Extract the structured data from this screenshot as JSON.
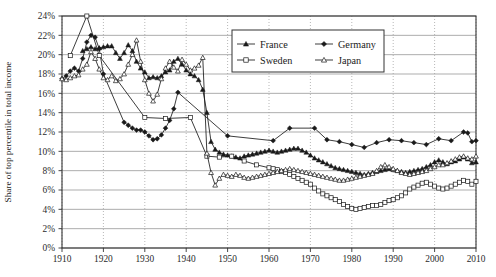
{
  "chart_data": {
    "type": "line",
    "title": "",
    "xlabel": "",
    "ylabel": "Share of top percentile in total income",
    "xlim": [
      1910,
      2010
    ],
    "ylim": [
      0,
      24
    ],
    "grid": true,
    "legend_position": "top-right",
    "xticks": [
      "1910",
      "1920",
      "1930",
      "1940",
      "1950",
      "1960",
      "1970",
      "1980",
      "1990",
      "2000",
      "2010"
    ],
    "yticks": [
      "0%",
      "2%",
      "4%",
      "6%",
      "8%",
      "10%",
      "12%",
      "14%",
      "16%",
      "18%",
      "20%",
      "22%",
      "24%"
    ],
    "series": [
      {
        "name": "France",
        "marker": "filled-triangle",
        "x": [
          1915,
          1916,
          1917,
          1918,
          1919,
          1920,
          1921,
          1922,
          1923,
          1924,
          1925,
          1926,
          1927,
          1928,
          1929,
          1930,
          1931,
          1932,
          1933,
          1934,
          1935,
          1936,
          1937,
          1938,
          1939,
          1940,
          1941,
          1942,
          1943,
          1944,
          1945,
          1946,
          1947,
          1948,
          1949,
          1950,
          1951,
          1952,
          1953,
          1954,
          1955,
          1956,
          1957,
          1958,
          1959,
          1960,
          1961,
          1962,
          1963,
          1964,
          1965,
          1966,
          1967,
          1968,
          1969,
          1970,
          1971,
          1972,
          1973,
          1974,
          1975,
          1976,
          1977,
          1978,
          1979,
          1980,
          1981,
          1982,
          1983,
          1984,
          1985,
          1986,
          1987,
          1988,
          1989,
          1990,
          1991,
          1992,
          1993,
          1994,
          1995,
          1996,
          1997,
          1998,
          1999,
          2000,
          2001,
          2002,
          2003,
          2004,
          2005,
          2006,
          2007,
          2008,
          2009,
          2010
        ],
        "y": [
          20.4,
          20.6,
          20.8,
          20.6,
          20.7,
          20.8,
          20.9,
          20.9,
          20.2,
          19.6,
          20.2,
          21.0,
          20.4,
          19.3,
          18.6,
          18.2,
          17.6,
          17.7,
          17.6,
          17.8,
          18.2,
          18.4,
          19.3,
          19.6,
          19.0,
          18.4,
          18.0,
          17.8,
          17.4,
          16.4,
          14.0,
          11.0,
          10.2,
          9.9,
          9.7,
          9.6,
          9.5,
          9.4,
          9.3,
          9.5,
          9.6,
          9.7,
          9.8,
          9.9,
          10.0,
          10.1,
          10.0,
          9.9,
          10.0,
          10.1,
          10.2,
          10.3,
          10.3,
          10.1,
          9.9,
          9.6,
          9.3,
          9.1,
          8.9,
          8.7,
          8.5,
          8.3,
          8.2,
          8.1,
          8.0,
          7.9,
          7.8,
          7.7,
          7.6,
          7.7,
          7.8,
          7.9,
          8.0,
          8.1,
          8.2,
          8.1,
          8.0,
          7.9,
          7.8,
          7.9,
          8.0,
          8.1,
          8.2,
          8.4,
          8.6,
          8.9,
          9.1,
          8.9,
          8.7,
          8.9,
          9.0,
          9.2,
          9.4,
          9.2,
          8.8,
          8.9
        ]
      },
      {
        "name": "Germany",
        "marker": "filled-diamond",
        "x": [
          1910,
          1911,
          1912,
          1913,
          1914,
          1915,
          1916,
          1917,
          1918,
          1919,
          1920,
          1925,
          1926,
          1927,
          1928,
          1929,
          1930,
          1931,
          1932,
          1933,
          1934,
          1935,
          1936,
          1937,
          1938,
          1950,
          1961,
          1965,
          1971,
          1974,
          1977,
          1980,
          1983,
          1986,
          1989,
          1992,
          1995,
          1998,
          2001,
          2004,
          2007,
          2008,
          2009,
          2010
        ],
        "y": [
          17.5,
          17.8,
          18.3,
          18.6,
          18.3,
          19.6,
          21.3,
          22.0,
          21.8,
          20.6,
          18.0,
          13.0,
          12.7,
          12.4,
          12.2,
          12.2,
          12.0,
          11.6,
          11.2,
          11.3,
          11.7,
          12.4,
          13.2,
          14.4,
          16.1,
          11.6,
          11.1,
          12.4,
          12.4,
          11.2,
          11.0,
          10.7,
          10.4,
          10.9,
          11.2,
          11.1,
          10.9,
          10.7,
          11.3,
          11.1,
          12.0,
          11.9,
          11.0,
          11.1
        ]
      },
      {
        "name": "Sweden",
        "marker": "open-square",
        "x": [
          1912,
          1916,
          1919,
          1930,
          1935,
          1941,
          1945,
          1948,
          1951,
          1954,
          1957,
          1960,
          1961,
          1962,
          1963,
          1964,
          1965,
          1966,
          1967,
          1968,
          1969,
          1970,
          1971,
          1972,
          1973,
          1974,
          1975,
          1976,
          1977,
          1978,
          1979,
          1980,
          1981,
          1982,
          1983,
          1984,
          1985,
          1986,
          1987,
          1988,
          1989,
          1990,
          1991,
          1992,
          1993,
          1994,
          1995,
          1996,
          1997,
          1998,
          1999,
          2000,
          2001,
          2002,
          2003,
          2004,
          2005,
          2006,
          2007,
          2008,
          2009,
          2010
        ],
        "y": [
          19.9,
          24.0,
          19.9,
          13.5,
          13.4,
          13.5,
          9.5,
          9.4,
          9.5,
          9.0,
          8.6,
          8.3,
          8.2,
          8.1,
          7.9,
          7.8,
          7.6,
          7.4,
          7.2,
          7.0,
          6.8,
          6.6,
          6.2,
          5.9,
          5.6,
          5.4,
          5.2,
          5.0,
          4.8,
          4.5,
          4.3,
          4.1,
          4.0,
          4.1,
          4.2,
          4.3,
          4.4,
          4.4,
          4.5,
          4.7,
          4.9,
          5.0,
          5.2,
          5.4,
          5.7,
          6.1,
          6.3,
          6.5,
          6.7,
          6.8,
          6.6,
          6.4,
          6.2,
          6.1,
          6.2,
          6.4,
          6.6,
          6.8,
          7.0,
          6.9,
          6.6,
          6.9
        ]
      },
      {
        "name": "Japan",
        "marker": "open-triangle",
        "x": [
          1910,
          1911,
          1912,
          1913,
          1914,
          1915,
          1916,
          1917,
          1918,
          1919,
          1920,
          1921,
          1922,
          1923,
          1924,
          1925,
          1926,
          1927,
          1928,
          1929,
          1930,
          1931,
          1932,
          1933,
          1934,
          1935,
          1936,
          1937,
          1938,
          1939,
          1940,
          1941,
          1942,
          1943,
          1944,
          1945,
          1946,
          1947,
          1948,
          1949,
          1950,
          1951,
          1952,
          1953,
          1954,
          1955,
          1956,
          1957,
          1958,
          1959,
          1960,
          1961,
          1962,
          1963,
          1964,
          1965,
          1966,
          1967,
          1968,
          1969,
          1970,
          1971,
          1972,
          1973,
          1974,
          1975,
          1976,
          1977,
          1978,
          1979,
          1980,
          1981,
          1982,
          1983,
          1984,
          1985,
          1986,
          1987,
          1988,
          1989,
          1990,
          1991,
          1992,
          1993,
          1994,
          1995,
          1996,
          1997,
          1998,
          1999,
          2000,
          2001,
          2002,
          2003,
          2004,
          2005,
          2006,
          2007,
          2008,
          2009,
          2010
        ],
        "y": [
          17.5,
          17.4,
          17.6,
          17.8,
          17.9,
          18.5,
          19.0,
          20.3,
          19.6,
          18.5,
          17.6,
          17.4,
          17.8,
          17.3,
          17.5,
          18.0,
          19.0,
          20.0,
          21.5,
          19.3,
          17.4,
          16.0,
          15.2,
          15.9,
          17.5,
          18.6,
          19.3,
          18.7,
          18.3,
          19.5,
          19.0,
          18.4,
          18.6,
          18.9,
          19.7,
          9.8,
          7.8,
          6.5,
          7.2,
          7.6,
          7.5,
          7.4,
          7.6,
          7.5,
          7.3,
          7.2,
          7.3,
          7.4,
          7.5,
          7.6,
          7.7,
          7.8,
          7.9,
          8.0,
          8.1,
          8.2,
          8.1,
          8.0,
          7.9,
          7.8,
          7.7,
          7.6,
          7.5,
          7.4,
          7.3,
          7.2,
          7.1,
          7.0,
          7.0,
          7.1,
          7.2,
          7.3,
          7.4,
          7.5,
          7.6,
          7.7,
          8.0,
          8.4,
          8.6,
          8.4,
          8.2,
          8.0,
          7.8,
          7.7,
          7.6,
          7.7,
          7.8,
          7.9,
          8.0,
          8.2,
          8.4,
          8.6,
          8.6,
          8.8,
          9.0,
          9.2,
          9.4,
          9.5,
          9.3,
          9.2,
          9.5
        ]
      }
    ]
  },
  "legend": {
    "items": [
      {
        "label": "France"
      },
      {
        "label": "Germany"
      },
      {
        "label": "Sweden"
      },
      {
        "label": "Japan"
      }
    ]
  },
  "colors": {
    "line": "#1a1a1a",
    "grid_horizontal": "#8a8a8a",
    "grid_vertical": "#9a9a9a",
    "axis": "#333333",
    "background": "#ffffff"
  }
}
